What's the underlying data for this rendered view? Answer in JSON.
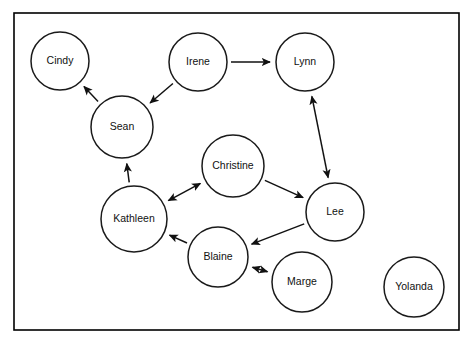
{
  "diagram": {
    "type": "node-link-diagram",
    "background_color": "#ffffff",
    "frame": {
      "x": 14,
      "y": 13,
      "width": 445,
      "height": 317,
      "stroke_color": "#000000"
    },
    "node_style": {
      "fill_color": "#ffffff",
      "stroke_color": "#1a1a1a",
      "label_color": "#111111"
    },
    "edge_style": {
      "stroke_color": "#111111",
      "arrowhead": "solid-triangle"
    },
    "nodes": [
      {
        "id": "cindy",
        "label": "Cindy",
        "x": 60,
        "y": 61,
        "r": 29
      },
      {
        "id": "irene",
        "label": "Irene",
        "x": 198,
        "y": 62,
        "r": 29
      },
      {
        "id": "lynn",
        "label": "Lynn",
        "x": 305,
        "y": 62,
        "r": 29
      },
      {
        "id": "sean",
        "label": "Sean",
        "x": 122,
        "y": 127,
        "r": 31
      },
      {
        "id": "christine",
        "label": "Christine",
        "x": 233,
        "y": 166,
        "r": 31
      },
      {
        "id": "lee",
        "label": "Lee",
        "x": 335,
        "y": 212,
        "r": 29
      },
      {
        "id": "kathleen",
        "label": "Kathleen",
        "x": 134,
        "y": 219,
        "r": 33
      },
      {
        "id": "blaine",
        "label": "Blaine",
        "x": 218,
        "y": 257,
        "r": 30
      },
      {
        "id": "marge",
        "label": "Marge",
        "x": 302,
        "y": 282,
        "r": 30
      },
      {
        "id": "yolanda",
        "label": "Yolanda",
        "x": 414,
        "y": 287,
        "r": 30
      }
    ],
    "edges": [
      {
        "id": "sean-cindy",
        "source": "sean",
        "target": "cindy",
        "direction": "one-way"
      },
      {
        "id": "irene-sean",
        "source": "irene",
        "target": "sean",
        "direction": "one-way"
      },
      {
        "id": "irene-lynn",
        "source": "irene",
        "target": "lynn",
        "direction": "one-way"
      },
      {
        "id": "lynn-lee",
        "source": "lynn",
        "target": "lee",
        "direction": "two-way"
      },
      {
        "id": "kathleen-sean",
        "source": "kathleen",
        "target": "sean",
        "direction": "one-way"
      },
      {
        "id": "kathleen-christine",
        "source": "kathleen",
        "target": "christine",
        "direction": "two-way"
      },
      {
        "id": "christine-lee",
        "source": "christine",
        "target": "lee",
        "direction": "one-way"
      },
      {
        "id": "lee-blaine",
        "source": "lee",
        "target": "blaine",
        "direction": "one-way"
      },
      {
        "id": "blaine-kathleen",
        "source": "blaine",
        "target": "kathleen",
        "direction": "one-way"
      },
      {
        "id": "blaine-marge",
        "source": "blaine",
        "target": "marge",
        "direction": "two-way"
      }
    ],
    "isolated_nodes": [
      "yolanda"
    ]
  }
}
